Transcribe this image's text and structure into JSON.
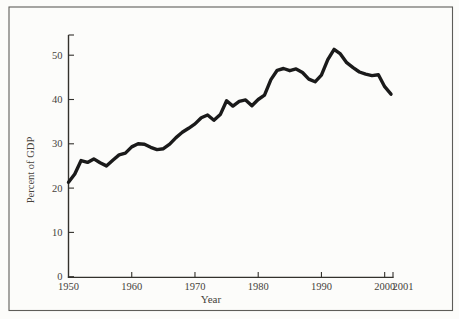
{
  "figure": {
    "background": "#fcfcfa",
    "frame_color": "#5e5d59",
    "axis_color": "#33312c",
    "text_color": "#46423a",
    "line_color": "#1a1a1a"
  },
  "chart_data": {
    "type": "line",
    "title": "",
    "xlabel": "Year",
    "ylabel": "Percent of GDP",
    "series_name": "percent-of-gdp",
    "x": [
      1950,
      1951,
      1952,
      1953,
      1954,
      1955,
      1956,
      1957,
      1958,
      1959,
      1960,
      1961,
      1962,
      1963,
      1964,
      1965,
      1966,
      1967,
      1968,
      1969,
      1970,
      1971,
      1972,
      1973,
      1974,
      1975,
      1976,
      1977,
      1978,
      1979,
      1980,
      1981,
      1982,
      1983,
      1984,
      1985,
      1986,
      1987,
      1988,
      1989,
      1990,
      1991,
      1992,
      1993,
      1994,
      1995,
      1996,
      1997,
      1998,
      1999,
      2000,
      2001
    ],
    "values": [
      21.3,
      23.2,
      26.2,
      25.8,
      26.6,
      25.7,
      25.0,
      26.3,
      27.5,
      27.9,
      29.3,
      30.0,
      29.9,
      29.2,
      28.7,
      28.9,
      29.9,
      31.4,
      32.6,
      33.5,
      34.5,
      35.9,
      36.5,
      35.3,
      36.6,
      39.7,
      38.5,
      39.6,
      39.9,
      38.6,
      40.0,
      41.0,
      44.5,
      46.6,
      47.0,
      46.5,
      46.9,
      46.1,
      44.6,
      44.0,
      45.5,
      49.0,
      51.3,
      50.3,
      48.3,
      47.2,
      46.2,
      45.7,
      45.4,
      45.6,
      42.9,
      41.2
    ],
    "xlim": [
      1950,
      2001
    ],
    "ylim": [
      0,
      55
    ],
    "y_ticks": [
      0,
      10,
      20,
      30,
      40,
      50
    ],
    "y_tick_labels": [
      "0",
      "10",
      "20",
      "30",
      "40",
      "50"
    ],
    "x_ticks": [
      1960,
      1970,
      1980,
      1990,
      2000
    ],
    "x_tick_labels": [
      "1960",
      "1970",
      "1980",
      "1990",
      "2000"
    ],
    "x_edge_labels": {
      "left": "1950",
      "right": "2001"
    },
    "grid": false,
    "legend": "none"
  }
}
